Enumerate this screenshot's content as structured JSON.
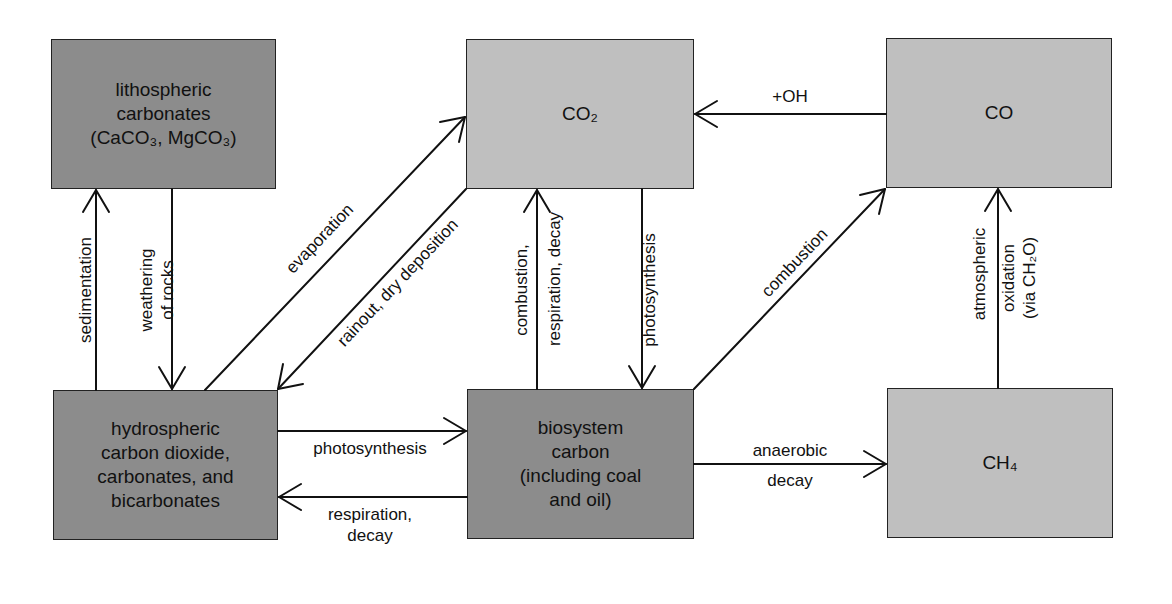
{
  "diagram": {
    "type": "flowchart",
    "title": "",
    "nodes": [
      {
        "id": "lithospheric",
        "label": "lithospheric\ncarbonates\n(CaCO₃, MgCO₃)",
        "shade": "dark"
      },
      {
        "id": "co2",
        "label": "CO₂",
        "shade": "light"
      },
      {
        "id": "co",
        "label": "CO",
        "shade": "light"
      },
      {
        "id": "hydrospheric",
        "label": "hydrospheric\ncarbon dioxide,\ncarbonates, and\nbicarbonates",
        "shade": "dark"
      },
      {
        "id": "biosystem",
        "label": "biosystem\ncarbon\n(including coal\nand oil)",
        "shade": "dark"
      },
      {
        "id": "ch4",
        "label": "CH₄",
        "shade": "light"
      }
    ],
    "edges": [
      {
        "from": "hydrospheric",
        "to": "lithospheric",
        "label": "sedimentation"
      },
      {
        "from": "lithospheric",
        "to": "hydrospheric",
        "label": "weathering\nof rocks"
      },
      {
        "from": "hydrospheric",
        "to": "co2",
        "label": "evaporation"
      },
      {
        "from": "co2",
        "to": "hydrospheric",
        "label": "rainout, dry deposition"
      },
      {
        "from": "biosystem",
        "to": "co2",
        "label_left": "combustion,",
        "label_right": "respiration, decay"
      },
      {
        "from": "co2",
        "to": "biosystem",
        "label": "photosynthesis"
      },
      {
        "from": "co",
        "to": "co2",
        "label": "+OH"
      },
      {
        "from": "biosystem",
        "to": "co",
        "label": "combustion"
      },
      {
        "from": "ch4",
        "to": "co",
        "label_left": "atmospheric",
        "label_right": "oxidation\n(via CH₂O)"
      },
      {
        "from": "hydrospheric",
        "to": "biosystem",
        "label": "photosynthesis"
      },
      {
        "from": "biosystem",
        "to": "hydrospheric",
        "label": "respiration,\ndecay"
      },
      {
        "from": "biosystem",
        "to": "ch4",
        "label": "anaerobic\ndecay"
      }
    ]
  },
  "colors": {
    "dark_box": "#8c8c8c",
    "light_box": "#bfbfbf",
    "line": "#111111"
  }
}
